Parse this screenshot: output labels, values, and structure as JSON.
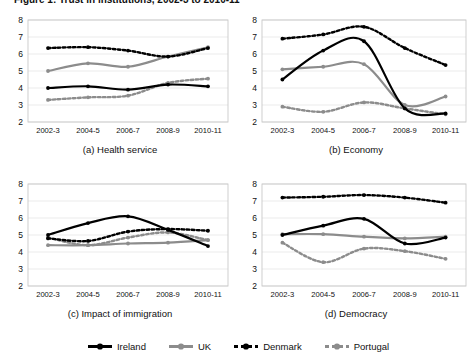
{
  "figure": {
    "clipped_title": "Figure 1: Trust in institutions, 2002-3 to 2010-11",
    "background": "#ffffff"
  },
  "series_style": {
    "ireland": {
      "color": "#000000",
      "dash": "solid",
      "width": 2.2
    },
    "uk": {
      "color": "#8c8c8c",
      "dash": "solid",
      "width": 2.2
    },
    "denmark": {
      "color": "#000000",
      "dash": "dotted",
      "width": 2.4
    },
    "portugal": {
      "color": "#8c8c8c",
      "dash": "dotted",
      "width": 2.4
    }
  },
  "legend": {
    "position": "bottom-center",
    "items": [
      {
        "label": "Ireland",
        "key": "ireland",
        "color": "#000000",
        "style": "solid"
      },
      {
        "label": "UK",
        "key": "uk",
        "color": "#8c8c8c",
        "style": "solid"
      },
      {
        "label": "Denmark",
        "key": "denmark",
        "color": "#000000",
        "style": "dotted"
      },
      {
        "label": "Portugal",
        "key": "portugal",
        "color": "#8c8c8c",
        "style": "dotted"
      }
    ]
  },
  "axis": {
    "ylim": [
      2,
      8
    ],
    "yticks": [
      "2",
      "3",
      "4",
      "5",
      "6",
      "7",
      "8"
    ],
    "xticks": [
      "2002-3",
      "2004-5",
      "2006-7",
      "2008-9",
      "2010-11"
    ],
    "grid": true,
    "grid_color": "#e6e6e6"
  },
  "chart_data": [
    {
      "type": "line",
      "id": "a",
      "title": "(a) Health service",
      "xlabel": "",
      "ylabel": "",
      "ylim": [
        2,
        8
      ],
      "yticks": [
        2,
        3,
        4,
        5,
        6,
        7,
        8
      ],
      "categories": [
        "2002-3",
        "2004-5",
        "2006-7",
        "2008-9",
        "2010-11"
      ],
      "grid": true,
      "legend_position": "figure-bottom",
      "series": [
        {
          "name": "Ireland",
          "values": [
            4.0,
            4.1,
            3.9,
            4.2,
            4.1
          ]
        },
        {
          "name": "UK",
          "values": [
            5.0,
            5.45,
            5.25,
            5.85,
            6.4
          ]
        },
        {
          "name": "Denmark",
          "values": [
            6.35,
            6.4,
            6.2,
            5.85,
            6.35
          ]
        },
        {
          "name": "Portugal",
          "values": [
            3.3,
            3.45,
            3.55,
            4.3,
            4.55
          ]
        }
      ]
    },
    {
      "type": "line",
      "id": "b",
      "title": "(b) Economy",
      "xlabel": "",
      "ylabel": "",
      "ylim": [
        2,
        8
      ],
      "yticks": [
        2,
        3,
        4,
        5,
        6,
        7,
        8
      ],
      "categories": [
        "2002-3",
        "2004-5",
        "2006-7",
        "2008-9",
        "2010-11"
      ],
      "grid": true,
      "legend_position": "figure-bottom",
      "series": [
        {
          "name": "Ireland",
          "values": [
            4.5,
            6.2,
            6.75,
            2.8,
            2.5
          ]
        },
        {
          "name": "UK",
          "values": [
            5.1,
            5.25,
            5.4,
            3.0,
            3.5
          ]
        },
        {
          "name": "Denmark",
          "values": [
            6.9,
            7.15,
            7.6,
            6.35,
            5.35
          ]
        },
        {
          "name": "Portugal",
          "values": [
            2.9,
            2.6,
            3.15,
            2.8,
            2.45
          ]
        }
      ]
    },
    {
      "type": "line",
      "id": "c",
      "title": "(c) Impact of immigration",
      "xlabel": "",
      "ylabel": "",
      "ylim": [
        2,
        8
      ],
      "yticks": [
        2,
        3,
        4,
        5,
        6,
        7,
        8
      ],
      "categories": [
        "2002-3",
        "2004-5",
        "2006-7",
        "2008-9",
        "2010-11"
      ],
      "grid": true,
      "legend_position": "figure-bottom",
      "series": [
        {
          "name": "Ireland",
          "values": [
            5.0,
            5.7,
            6.1,
            5.3,
            4.35
          ]
        },
        {
          "name": "UK",
          "values": [
            4.4,
            4.4,
            4.5,
            4.55,
            4.7
          ]
        },
        {
          "name": "Denmark",
          "values": [
            4.8,
            4.65,
            5.2,
            5.35,
            5.25
          ]
        },
        {
          "name": "Portugal",
          "values": [
            4.85,
            4.4,
            4.85,
            5.15,
            4.7
          ]
        }
      ]
    },
    {
      "type": "line",
      "id": "d",
      "title": "(d) Democracy",
      "xlabel": "",
      "ylabel": "",
      "ylim": [
        2,
        8
      ],
      "yticks": [
        2,
        3,
        4,
        5,
        6,
        7,
        8
      ],
      "categories": [
        "2002-3",
        "2004-5",
        "2006-7",
        "2008-9",
        "2010-11"
      ],
      "grid": true,
      "legend_position": "figure-bottom",
      "series": [
        {
          "name": "Ireland",
          "values": [
            5.0,
            5.55,
            5.95,
            4.5,
            4.85
          ]
        },
        {
          "name": "UK",
          "values": [
            5.05,
            5.05,
            4.9,
            4.8,
            4.9
          ]
        },
        {
          "name": "Denmark",
          "values": [
            7.2,
            7.25,
            7.35,
            7.2,
            6.9
          ]
        },
        {
          "name": "Portugal",
          "values": [
            4.55,
            3.4,
            4.2,
            4.05,
            3.6
          ]
        }
      ]
    }
  ]
}
